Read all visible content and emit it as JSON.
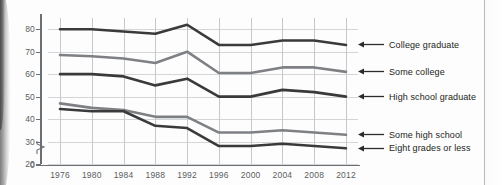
{
  "chart_data": {
    "type": "line",
    "title": "",
    "subtitle": "",
    "xlabel": "",
    "ylabel": "",
    "x": [
      1976,
      1980,
      1984,
      1988,
      1992,
      1996,
      2000,
      2004,
      2008,
      2012
    ],
    "xtick_labels": [
      "1976",
      "1980",
      "1984",
      "1988",
      "1992",
      "1996",
      "2000",
      "2004",
      "2008",
      "2012"
    ],
    "ytick_labels": [
      "0",
      "20",
      "30",
      "40",
      "50",
      "60",
      "70",
      "80"
    ],
    "ytick_values": [
      0,
      20,
      30,
      40,
      50,
      60,
      70,
      80
    ],
    "ylim": [
      20,
      85
    ],
    "y_axis_break": true,
    "y_axis_break_glyph": "break-symbol",
    "grid": "both",
    "legend_position": "right-inline-arrows",
    "series": [
      {
        "name": "College graduate",
        "color": "#3a3a3a",
        "values": [
          80,
          80,
          79,
          78,
          82,
          73,
          73,
          75,
          75,
          73
        ]
      },
      {
        "name": "Some college",
        "color": "#7e8084",
        "values": [
          68.5,
          68,
          67,
          65,
          70,
          60.5,
          60.5,
          63,
          63,
          61
        ]
      },
      {
        "name": "High school graduate",
        "color": "#3a3a3a",
        "values": [
          60,
          60,
          59,
          55,
          58,
          50,
          50,
          53,
          52,
          50
        ]
      },
      {
        "name": "Some high school",
        "color": "#7e8084",
        "values": [
          47,
          45,
          44,
          41,
          41,
          34,
          34,
          35,
          34,
          33
        ]
      },
      {
        "name": "Eight grades or less",
        "color": "#3a3a3a",
        "values": [
          44.5,
          43.5,
          43.5,
          37,
          36,
          28,
          28,
          29,
          28,
          27
        ]
      }
    ]
  },
  "legend": {
    "items": [
      {
        "label": "College graduate",
        "arrow_icon": "left-arrow-icon"
      },
      {
        "label": "Some college",
        "arrow_icon": "left-arrow-icon"
      },
      {
        "label": "High school graduate",
        "arrow_icon": "left-arrow-icon"
      },
      {
        "label": "Some high school",
        "arrow_icon": "left-arrow-icon"
      },
      {
        "label": "Eight grades or less",
        "arrow_icon": "left-arrow-icon"
      }
    ]
  },
  "colors": {
    "dark_series": "#3a3a3a",
    "gray_series": "#7e8084",
    "gridline": "#c6c9cc",
    "axis": "#6d7073",
    "tick_text": "#5a5d60",
    "label_text": "#1c1e20",
    "page_background": "#fdfdfd"
  }
}
